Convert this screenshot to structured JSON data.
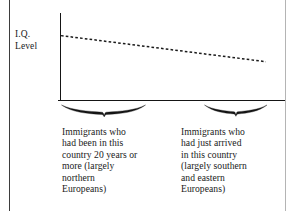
{
  "figure": {
    "background_color": "#ffffff",
    "ink_color": "#1a1a1a",
    "page_rule_color": "#3d3d3d"
  },
  "chart_data": {
    "type": "line",
    "title": "",
    "subtitle": "",
    "xlabel": "",
    "ylabel": "I.Q. Level",
    "ylabel_lines": [
      "I.Q.",
      "Level"
    ],
    "grid": false,
    "legend": "none",
    "axis_ranges": {
      "x": [
        0,
        1
      ],
      "y": [
        0,
        1
      ]
    },
    "tick_labels": {
      "x": [],
      "y": []
    },
    "series": [
      {
        "name": "I.Q. level trend",
        "style": "dashed",
        "color": "#1a1a1a",
        "x": [
          0.0,
          0.25,
          0.5,
          0.75,
          1.0
        ],
        "y": [
          0.74,
          0.665,
          0.59,
          0.515,
          0.44
        ],
        "description": "Steadily declining dashed trend line from left to right"
      }
    ],
    "categories": [
      "Immigrants who had been in this country 20 years or more (largely northern Europeans)",
      "Immigrants who had just arrived in this country (largely southern and eastern Europeans)"
    ],
    "annotations": [
      {
        "name": "left-group-brace",
        "type": "brace",
        "label_lines": [
          "Immigrants who",
          "had been in this",
          "country 20 years or",
          "more (largely",
          "northern",
          "Europeans)"
        ]
      },
      {
        "name": "right-group-brace",
        "type": "brace",
        "label_lines": [
          "Immigrants who",
          "had just arrived",
          "in this country",
          "(largely southern",
          "and eastern",
          "Europeans)"
        ]
      }
    ]
  },
  "y_axis": {
    "label_line1": "I.Q.",
    "label_line2": "Level"
  },
  "captions": {
    "left": {
      "line1": "Immigrants who",
      "line2": "had been in this",
      "line3": "country 20 years or",
      "line4": "more (largely",
      "line5": "northern",
      "line6": "Europeans)"
    },
    "right": {
      "line1": "Immigrants who",
      "line2": "had just arrived",
      "line3": "in this country",
      "line4": "(largely southern",
      "line5": "and eastern",
      "line6": "Europeans)"
    }
  }
}
